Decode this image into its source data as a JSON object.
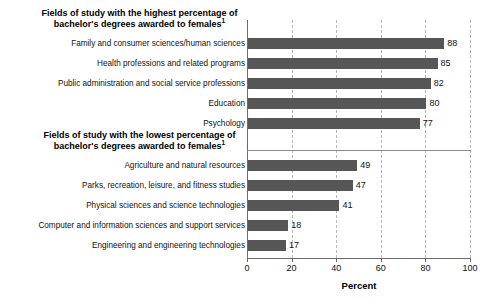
{
  "chart_data": {
    "type": "bar",
    "orientation": "horizontal",
    "title": "",
    "xlabel": "Percent",
    "ylabel": "",
    "xlim": [
      0,
      100
    ],
    "xticks": [
      "0",
      "20",
      "40",
      "60",
      "80",
      "100"
    ],
    "grid": "vertical-dashed",
    "legend": "none",
    "bar_color": "#565656",
    "sections": [
      {
        "heading": "Fields of study with the highest percentage of bachelor's degrees awarded to females",
        "heading_footnote": "1",
        "categories": [
          "Family and consumer sciences/human sciences",
          "Health professions and related programs",
          "Public administration and social service professions",
          "Education",
          "Psychology"
        ],
        "values": [
          88,
          85,
          82,
          80,
          77
        ]
      },
      {
        "heading": "Fields of study with the lowest percentage of bachelor's degrees awarded to females",
        "heading_footnote": "1",
        "categories": [
          "Agriculture and natural resources",
          "Parks, recreation, leisure, and fitness studies",
          "Physical sciences and science technologies",
          "Computer and information sciences and support services",
          "Engineering and engineering technologies"
        ],
        "values": [
          49,
          47,
          41,
          18,
          17
        ]
      }
    ]
  },
  "rows": [
    {
      "label": "Family and consumer sciences/human sciences",
      "value": 88,
      "value_text": "88"
    },
    {
      "label": "Health professions and related programs",
      "value": 85,
      "value_text": "85"
    },
    {
      "label": "Public administration and social service professions",
      "value": 82,
      "value_text": "82"
    },
    {
      "label": "Education",
      "value": 80,
      "value_text": "80"
    },
    {
      "label": "Psychology",
      "value": 77,
      "value_text": "77"
    },
    {
      "label": "Agriculture and natural resources",
      "value": 49,
      "value_text": "49"
    },
    {
      "label": "Parks, recreation, leisure, and fitness studies",
      "value": 47,
      "value_text": "47"
    },
    {
      "label": "Physical sciences and science technologies",
      "value": 41,
      "value_text": "41"
    },
    {
      "label": "Computer and information sciences and support services",
      "value": 18,
      "value_text": "18"
    },
    {
      "label": "Engineering and engineering technologies",
      "value": 17,
      "value_text": "17"
    }
  ],
  "headings": {
    "highest_line1": "Fields of study with the highest percentage of",
    "highest_line2": "bachelor's degrees awarded to females",
    "lowest_line1": "Fields of study with the lowest percentage of",
    "lowest_line2": "bachelor's degrees awarded to females",
    "footnote_marker": "1"
  },
  "axis": {
    "title": "Percent",
    "ticks": [
      "0",
      "20",
      "40",
      "60",
      "80",
      "100"
    ]
  }
}
